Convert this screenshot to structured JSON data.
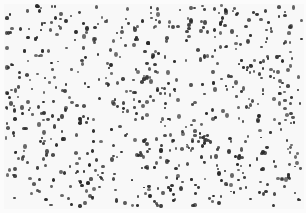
{
  "image": {
    "description": "Micrograph-like field of small dark particles scattered randomly on a light background",
    "background_color": "#f8f8f8",
    "particle_color": "#2b2b2b",
    "width": 306,
    "height": 213,
    "particle_count_estimate": 700
  }
}
